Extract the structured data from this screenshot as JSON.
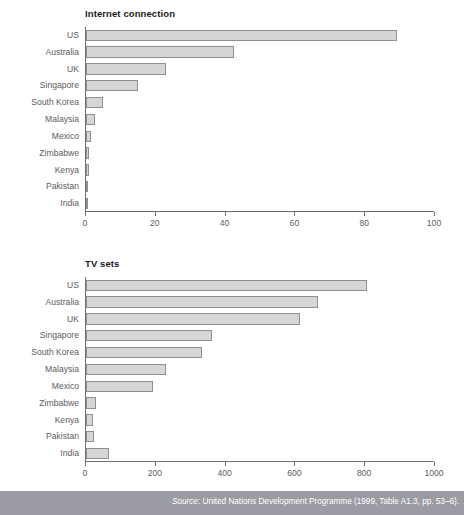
{
  "figure": {
    "top_clipped_caption": "",
    "source_prefix": "Source:",
    "source_text": " United Nations Development Programme (1999, Table A1.3, pp. 53–6).",
    "footer_color": "#9b9ba3",
    "bar_fill": "#d6d6d6",
    "bar_stroke": "#8f8f8f",
    "axis_color": "#6f6f6f",
    "label_color": "#5d5d5d"
  },
  "chart_data": [
    {
      "id": "internet",
      "type": "bar",
      "orientation": "horizontal",
      "title": "Internet connection",
      "xlabel": "",
      "ylabel": "",
      "xlim": [
        0,
        100
      ],
      "xticks": [
        0,
        20,
        40,
        60,
        80,
        100
      ],
      "xtick_labels": [
        "0",
        "20",
        "40",
        "60",
        "80",
        "100"
      ],
      "grid": false,
      "legend": null,
      "categories": [
        "US",
        "Australia",
        "UK",
        "Singapore",
        "South Korea",
        "Malaysia",
        "Mexico",
        "Zimbabwe",
        "Kenya",
        "Pakistan",
        "India"
      ],
      "values": [
        89,
        42.5,
        23,
        15,
        5,
        2.5,
        1.3,
        0.9,
        0.8,
        0.7,
        0.5
      ]
    },
    {
      "id": "tv",
      "type": "bar",
      "orientation": "horizontal",
      "title": "TV sets",
      "xlabel": "",
      "ylabel": "",
      "xlim": [
        0,
        1000
      ],
      "xticks": [
        0,
        200,
        400,
        600,
        800,
        1000
      ],
      "xtick_labels": [
        "0",
        "200",
        "400",
        "600",
        "800",
        "1000"
      ],
      "grid": false,
      "legend": null,
      "categories": [
        "US",
        "Australia",
        "UK",
        "Singapore",
        "South Korea",
        "Malaysia",
        "Mexico",
        "Zimbabwe",
        "Kenya",
        "Pakistan",
        "India"
      ],
      "values": [
        805,
        665,
        612,
        360,
        332,
        228,
        193,
        30,
        21,
        23,
        65
      ]
    }
  ]
}
